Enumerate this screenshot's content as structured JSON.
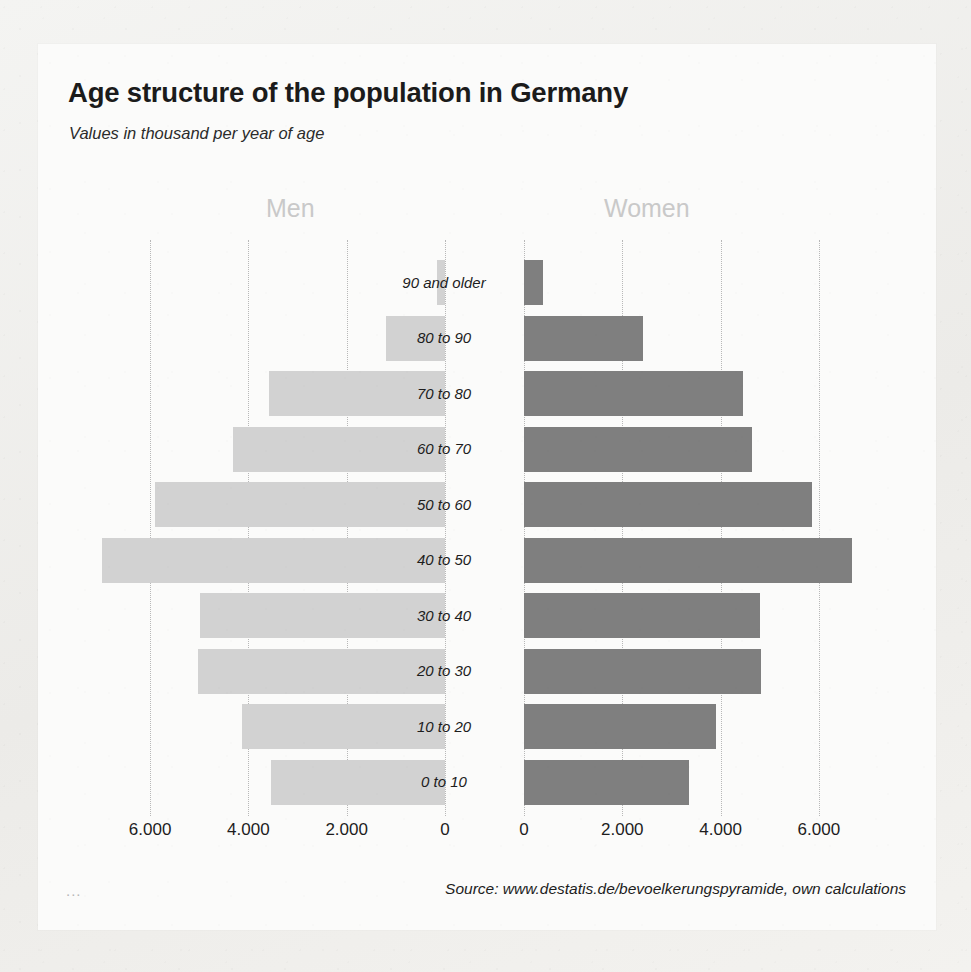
{
  "header": {
    "title": "Age structure of the population in Germany",
    "subtitle": "Values in thousand per year of age"
  },
  "footer": {
    "source": "Source: www.destatis.de/bevoelkerungspyramide, own calculations",
    "corner_mark": "..."
  },
  "colors": {
    "men_bar": "#d2d2d2",
    "women_bar": "#7f7f7f",
    "gridline": "#b8b8b8",
    "side_heading": "#c9c9c9",
    "card_background": "#fbfbfa",
    "page_background": "#f2f2f0",
    "text": "#1b1b1b"
  },
  "chart_data": {
    "type": "bar",
    "subtype": "population-pyramid",
    "title": "Age structure of the population in Germany",
    "subtitle": "Values in thousand per year of age",
    "xlabel": "",
    "ylabel": "",
    "units": "thousand",
    "grid": true,
    "legend_position": "top",
    "orientation": "horizontal-diverging",
    "categories": [
      "90 and older",
      "80 to 90",
      "70 to 80",
      "60 to 70",
      "50 to 60",
      "40 to 50",
      "30 to 40",
      "20 to 30",
      "10 to 20",
      "0 to 10"
    ],
    "series": [
      {
        "name": "Men",
        "side": "left",
        "color": "#d2d2d2",
        "values": [
          160,
          1210,
          3580,
          4320,
          5910,
          6980,
          4980,
          5020,
          4130,
          3540
        ]
      },
      {
        "name": "Women",
        "side": "right",
        "color": "#7f7f7f",
        "values": [
          390,
          2420,
          4460,
          4640,
          5860,
          6670,
          4800,
          4820,
          3900,
          3350
        ]
      }
    ],
    "axis_left": {
      "ticks": [
        6000,
        4000,
        2000,
        0
      ],
      "tick_labels": [
        "6.000",
        "4.000",
        "2.000",
        "0"
      ],
      "max": 7000
    },
    "axis_right": {
      "ticks": [
        0,
        2000,
        4000,
        6000
      ],
      "tick_labels": [
        "0",
        "2.000",
        "4.000",
        "6.000"
      ],
      "max": 7000
    }
  }
}
